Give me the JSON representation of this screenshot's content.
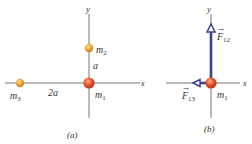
{
  "panel_a": {
    "caption": "(a)",
    "axis_x_label": "x",
    "axis_y_label": "y",
    "masses": [
      {
        "name": "m1",
        "label": "m",
        "sub": "1",
        "color": "#e8502a"
      },
      {
        "name": "m2",
        "label": "m",
        "sub": "2",
        "color": "#f2a531"
      },
      {
        "name": "m3",
        "label": "m",
        "sub": "3",
        "color": "#f2a531"
      }
    ],
    "distances": {
      "m1_m2": "a",
      "m1_m3": "2a"
    }
  },
  "panel_b": {
    "caption": "(b)",
    "axis_x_label": "x",
    "axis_y_label": "y",
    "mass": {
      "label": "m",
      "sub": "1",
      "color": "#e8502a"
    },
    "forces": [
      {
        "name": "F12",
        "label": "F",
        "sub": "12",
        "direction": "up",
        "color": "#3d3f8f"
      },
      {
        "name": "F13",
        "label": "F",
        "sub": "13",
        "direction": "left",
        "color": "#3d3f8f"
      }
    ]
  },
  "stray_axis_label": "x"
}
